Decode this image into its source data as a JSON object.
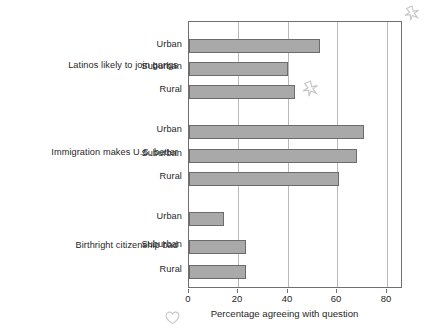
{
  "chart_data": {
    "type": "bar",
    "orientation": "horizontal",
    "title": "",
    "xlabel": "Percentage agreeing with question",
    "ylabel": "",
    "xlim": [
      0,
      86
    ],
    "xticks": [
      0,
      20,
      40,
      60,
      80
    ],
    "xtick_labels": [
      "0",
      "20",
      "40",
      "60",
      "80"
    ],
    "grid": "vertical",
    "legend": "none",
    "bar_color": "#a9a9a9",
    "bar_edge_color": "#6b6b6b",
    "groups": [
      {
        "label": "Latinos likely to join gangs",
        "categories": [
          "Urban",
          "Suburban",
          "Rural"
        ],
        "values": [
          53,
          40,
          43
        ]
      },
      {
        "label": "Immigration makes U.S. better",
        "categories": [
          "Urban",
          "Suburban",
          "Rural"
        ],
        "values": [
          71,
          68,
          61
        ]
      },
      {
        "label": "Birthright citizenship bad",
        "categories": [
          "Urban",
          "Suburban",
          "Rural"
        ],
        "values": [
          14,
          23,
          23
        ]
      }
    ]
  },
  "annotations": {
    "star_top_right": "star-mark",
    "star_near_rural_gangs": "star-mark",
    "heart_bottom_left": "heart-mark"
  }
}
